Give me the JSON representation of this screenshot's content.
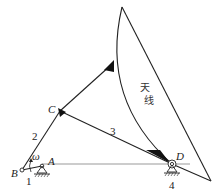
{
  "diagram": {
    "type": "linkage-mechanism",
    "points": {
      "A": {
        "label": "A"
      },
      "B": {
        "label": "B"
      },
      "C": {
        "label": "C"
      },
      "D": {
        "label": "D"
      }
    },
    "links": {
      "link1": {
        "label": "1"
      },
      "link2": {
        "label": "2"
      },
      "link3": {
        "label": "3"
      },
      "link4": {
        "label": "4"
      }
    },
    "angular_velocity": {
      "label": "ω"
    },
    "antenna": {
      "label_line1": "天",
      "label_line2": "线"
    },
    "colors": {
      "stroke": "#222222",
      "background": "#ffffff"
    }
  }
}
